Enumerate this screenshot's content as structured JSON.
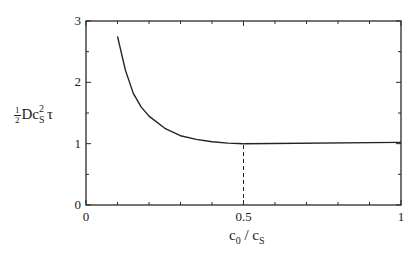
{
  "chart_data": {
    "type": "line",
    "title": "",
    "xlabel": "c_0 / c_s",
    "ylabel": "(1/2) D c_s^2 τ",
    "xlim": [
      0,
      1
    ],
    "ylim": [
      0,
      3
    ],
    "xticks": [
      0,
      0.5,
      1
    ],
    "xtick_labels": [
      "0",
      "0.5",
      "1"
    ],
    "xminor_ticks": [
      0.1,
      0.2,
      0.3,
      0.4,
      0.6,
      0.7,
      0.8,
      0.9
    ],
    "yticks": [
      0,
      1,
      2,
      3
    ],
    "ytick_labels": [
      "0",
      "1",
      "2",
      "3"
    ],
    "yminor_ticks": [
      0.5,
      1.5,
      2.5
    ],
    "grid": false,
    "legend": null,
    "series": [
      {
        "name": "curve",
        "style": "solid",
        "x": [
          0.1,
          0.125,
          0.15,
          0.175,
          0.2,
          0.25,
          0.3,
          0.35,
          0.4,
          0.45,
          0.5
        ],
        "y": [
          2.75,
          2.2,
          1.82,
          1.6,
          1.45,
          1.25,
          1.13,
          1.07,
          1.03,
          1.01,
          1.0
        ]
      },
      {
        "name": "plateau",
        "style": "solid",
        "x": [
          0.5,
          1.0
        ],
        "y": [
          1.0,
          1.02
        ]
      },
      {
        "name": "marker-line",
        "style": "dashed",
        "x": [
          0.5,
          0.5
        ],
        "y": [
          0,
          1.0
        ]
      }
    ]
  },
  "labels": {
    "y_frac_num": "1",
    "y_frac_den": "2",
    "y_main": "Dc",
    "y_sup": "2",
    "y_sub": "S",
    "y_tail": "τ",
    "x_c0": "c",
    "x_c0_sub": "0",
    "x_sep": " / ",
    "x_cs": "c",
    "x_cs_sub": "S"
  }
}
